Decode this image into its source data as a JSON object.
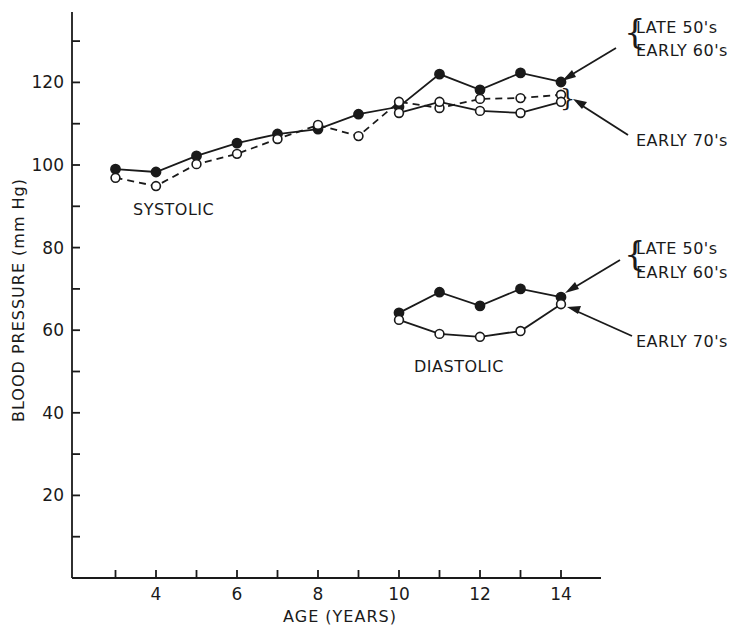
{
  "chart_data": {
    "type": "line",
    "title": "",
    "xlabel": "AGE (YEARS)",
    "ylabel": "BLOOD PRESSURE (mm Hg)",
    "xlim": [
      2.2,
      15
    ],
    "ylim": [
      0,
      136
    ],
    "x_ticks": [
      3,
      4,
      5,
      6,
      7,
      8,
      9,
      10,
      11,
      12,
      13,
      14
    ],
    "x_tick_labels": [
      "4",
      "6",
      "8",
      "10",
      "12",
      "14"
    ],
    "x_tick_label_values": [
      4,
      6,
      8,
      10,
      12,
      14
    ],
    "y_ticks": [
      10,
      20,
      30,
      40,
      50,
      60,
      70,
      80,
      90,
      100,
      110,
      120,
      130
    ],
    "y_tick_labels": [
      "20",
      "40",
      "60",
      "80",
      "100",
      "120"
    ],
    "y_tick_label_values": [
      20,
      40,
      60,
      80,
      100,
      120
    ],
    "grid": false,
    "legend_position": "annotations at right with arrows",
    "series": [
      {
        "name": "Systolic – Late 50's / Early 60's",
        "group": "SYSTOLIC",
        "marker": "filled-circle",
        "line": "solid",
        "x": [
          3,
          4,
          5,
          6,
          7,
          8,
          9,
          10,
          11,
          12,
          13,
          14
        ],
        "values": [
          99.0,
          98.3,
          102.2,
          105.3,
          107.5,
          108.7,
          112.3,
          114.1,
          122.0,
          118.2,
          122.3,
          120.1
        ]
      },
      {
        "name": "Systolic – Early 70's (dashed)",
        "group": "SYSTOLIC",
        "marker": "open-circle",
        "line": "dashed",
        "x": [
          3,
          4,
          5,
          6,
          7,
          8,
          9,
          10,
          11,
          12,
          13,
          14
        ],
        "values": [
          96.9,
          94.9,
          100.2,
          102.7,
          106.3,
          109.7,
          107.0,
          115.3,
          113.8,
          116.0,
          116.2,
          117.0
        ]
      },
      {
        "name": "Systolic – Early 70's (solid)",
        "group": "SYSTOLIC",
        "marker": "open-circle",
        "line": "solid",
        "x": [
          10,
          11,
          12,
          13,
          14
        ],
        "values": [
          112.6,
          115.3,
          113.1,
          112.6,
          115.3
        ]
      },
      {
        "name": "Diastolic – Late 50's / Early 60's",
        "group": "DIASTOLIC",
        "marker": "filled-circle",
        "line": "solid",
        "x": [
          10,
          11,
          12,
          13,
          14
        ],
        "values": [
          64.2,
          69.2,
          65.9,
          70.0,
          68.0
        ]
      },
      {
        "name": "Diastolic – Early 70's",
        "group": "DIASTOLIC",
        "marker": "open-circle",
        "line": "solid",
        "x": [
          10,
          11,
          12,
          13,
          14
        ],
        "values": [
          62.5,
          59.1,
          58.4,
          59.8,
          66.3
        ]
      }
    ],
    "annotations": [
      {
        "text": "SYSTOLIC",
        "x": 4.5,
        "y": 90
      },
      {
        "text": "DIASTOLIC",
        "x": 11.5,
        "y": 51
      },
      {
        "text": "LATE 50's / EARLY 60's",
        "target": "systolic filled at age 14"
      },
      {
        "text": "EARLY 70's",
        "target": "systolic open at age 14"
      },
      {
        "text": "LATE 50's / EARLY 60's",
        "target": "diastolic filled at age 14"
      },
      {
        "text": "EARLY 70's",
        "target": "diastolic open at age 14"
      }
    ]
  },
  "labels": {
    "xlabel": "AGE (YEARS)",
    "ylabel": "BLOOD PRESSURE (mm Hg)",
    "systolic": "SYSTOLIC",
    "diastolic": "DIASTOLIC",
    "legend_a_line1": "LATE 50's",
    "legend_a_line2": "EARLY 60's",
    "legend_b": "EARLY 70's"
  },
  "style": {
    "ink": "#1a1a1a",
    "background": "#ffffff"
  }
}
